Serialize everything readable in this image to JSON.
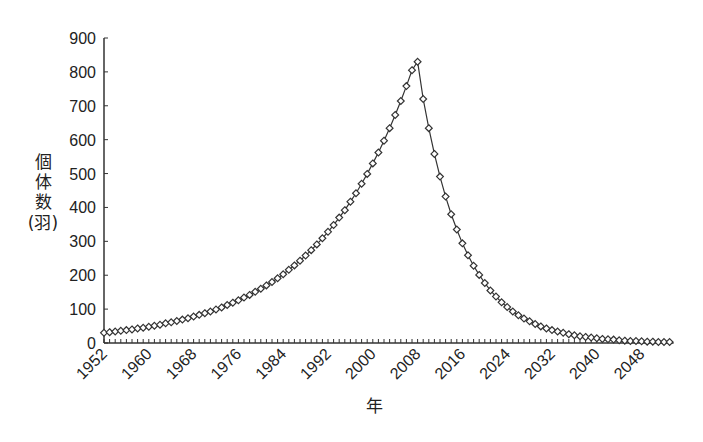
{
  "chart_data": {
    "type": "line",
    "title": "",
    "xlabel": "年",
    "ylabel": "個体数(羽)",
    "ylabel_lines": [
      "個",
      "体",
      "数",
      "(羽)"
    ],
    "ylim": [
      0,
      900
    ],
    "xlim": [
      1952,
      2053
    ],
    "y_ticks": [
      0,
      100,
      200,
      300,
      400,
      500,
      600,
      700,
      800,
      900
    ],
    "x_ticks": [
      1952,
      1960,
      1968,
      1976,
      1984,
      1992,
      2000,
      2008,
      2016,
      2024,
      2032,
      2040,
      2048
    ],
    "grid": false,
    "legend": null,
    "marker": "diamond-open",
    "line_color": "#333333",
    "series": [
      {
        "name": "個体数",
        "x": [
          1952,
          1953,
          1954,
          1955,
          1956,
          1957,
          1958,
          1959,
          1960,
          1961,
          1962,
          1963,
          1964,
          1965,
          1966,
          1967,
          1968,
          1969,
          1970,
          1971,
          1972,
          1973,
          1974,
          1975,
          1976,
          1977,
          1978,
          1979,
          1980,
          1981,
          1982,
          1983,
          1984,
          1985,
          1986,
          1987,
          1988,
          1989,
          1990,
          1991,
          1992,
          1993,
          1994,
          1995,
          1996,
          1997,
          1998,
          1999,
          2000,
          2001,
          2002,
          2003,
          2004,
          2005,
          2006,
          2007,
          2008,
          2009,
          2010,
          2011,
          2012,
          2013,
          2014,
          2015,
          2016,
          2017,
          2018,
          2019,
          2020,
          2021,
          2022,
          2023,
          2024,
          2025,
          2026,
          2027,
          2028,
          2029,
          2030,
          2031,
          2032,
          2033,
          2034,
          2035,
          2036,
          2037,
          2038,
          2039,
          2040,
          2041,
          2042,
          2043,
          2044,
          2045,
          2046,
          2047,
          2048,
          2049,
          2050,
          2051,
          2052,
          2053
        ],
        "values": [
          30,
          32,
          34,
          36,
          38,
          40,
          43,
          45,
          48,
          51,
          54,
          58,
          61,
          65,
          69,
          73,
          78,
          83,
          88,
          93,
          99,
          105,
          112,
          119,
          126,
          134,
          142,
          151,
          160,
          170,
          180,
          191,
          203,
          216,
          229,
          243,
          258,
          274,
          291,
          309,
          328,
          348,
          370,
          392,
          417,
          442,
          470,
          499,
          530,
          562,
          597,
          634,
          673,
          714,
          758,
          805,
          830,
          720,
          634,
          558,
          491,
          432,
          380,
          335,
          294,
          259,
          228,
          201,
          177,
          155,
          137,
          120,
          106,
          93,
          82,
          72,
          64,
          56,
          49,
          43,
          38,
          34,
          30,
          26,
          23,
          20,
          18,
          16,
          14,
          12,
          11,
          10,
          8,
          7,
          6,
          6,
          5,
          4,
          4,
          3,
          3,
          3
        ]
      }
    ]
  }
}
